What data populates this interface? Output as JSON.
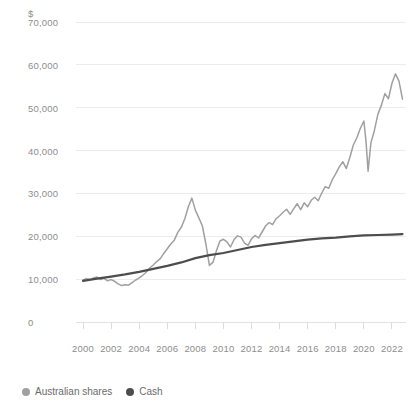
{
  "chart_data": {
    "type": "line",
    "title": "",
    "subtitle": "",
    "xlabel": "",
    "ylabel": "",
    "unit_label": "$",
    "grid": true,
    "legend_position": "bottom-left",
    "xlim": [
      1999.5,
      2023.0
    ],
    "ylim": [
      0,
      70000
    ],
    "ytick_labels": [
      "70,000",
      "60,000",
      "50,000",
      "40,000",
      "30,000",
      "20,000",
      "10,000",
      "0"
    ],
    "ytick_values": [
      70000,
      60000,
      50000,
      40000,
      30000,
      20000,
      10000,
      0
    ],
    "xtick_labels": [
      "2000",
      "2002",
      "2004",
      "2006",
      "2008",
      "2010",
      "2012",
      "2014",
      "2016",
      "2018",
      "2020",
      "2022"
    ],
    "xtick_values": [
      2000,
      2002,
      2004,
      2006,
      2008,
      2010,
      2012,
      2014,
      2016,
      2018,
      2020,
      2022
    ],
    "series": [
      {
        "name": "Australian shares",
        "color": "#a0a0a0",
        "x": [
          2000.0,
          2000.25,
          2000.5,
          2000.75,
          2001.0,
          2001.25,
          2001.5,
          2001.75,
          2002.0,
          2002.25,
          2002.5,
          2002.75,
          2003.0,
          2003.25,
          2003.5,
          2003.75,
          2004.0,
          2004.25,
          2004.5,
          2004.75,
          2005.0,
          2005.25,
          2005.5,
          2005.75,
          2006.0,
          2006.25,
          2006.5,
          2006.75,
          2007.0,
          2007.25,
          2007.5,
          2007.75,
          2008.0,
          2008.25,
          2008.5,
          2008.75,
          2009.0,
          2009.25,
          2009.5,
          2009.75,
          2010.0,
          2010.25,
          2010.5,
          2010.75,
          2011.0,
          2011.25,
          2011.5,
          2011.75,
          2012.0,
          2012.25,
          2012.5,
          2012.75,
          2013.0,
          2013.25,
          2013.5,
          2013.75,
          2014.0,
          2014.25,
          2014.5,
          2014.75,
          2015.0,
          2015.25,
          2015.5,
          2015.75,
          2016.0,
          2016.25,
          2016.5,
          2016.75,
          2017.0,
          2017.25,
          2017.5,
          2017.75,
          2018.0,
          2018.25,
          2018.5,
          2018.75,
          2019.0,
          2019.25,
          2019.5,
          2019.75,
          2020.0,
          2020.15,
          2020.3,
          2020.5,
          2020.75,
          2021.0,
          2021.25,
          2021.5,
          2021.75,
          2022.0,
          2022.25,
          2022.5,
          2022.75
        ],
        "values": [
          9800,
          10100,
          9900,
          10300,
          10500,
          9900,
          10200,
          9600,
          9900,
          9500,
          8900,
          8500,
          8700,
          8600,
          9200,
          9800,
          10300,
          10900,
          11600,
          12600,
          13300,
          14100,
          14800,
          16000,
          17100,
          18200,
          19100,
          20900,
          22100,
          24100,
          26900,
          28900,
          26100,
          24300,
          22400,
          18200,
          13200,
          13900,
          16600,
          18900,
          19300,
          18700,
          17500,
          19200,
          20100,
          19800,
          18400,
          17900,
          19400,
          20200,
          19600,
          21000,
          22400,
          23200,
          22700,
          24100,
          24800,
          25600,
          26300,
          25100,
          26400,
          27600,
          26200,
          27800,
          26900,
          28400,
          29100,
          28300,
          30100,
          31600,
          31200,
          33200,
          34600,
          36200,
          37400,
          35800,
          38400,
          41300,
          43000,
          45200,
          46900,
          42200,
          35200,
          41800,
          44700,
          48500,
          50600,
          53300,
          52100,
          55700,
          57900,
          56200,
          52000
        ]
      },
      {
        "name": "Cash",
        "color": "#4d4d4d",
        "x": [
          2000.0,
          2001.0,
          2002.0,
          2003.0,
          2004.0,
          2005.0,
          2006.0,
          2007.0,
          2008.0,
          2009.0,
          2010.0,
          2011.0,
          2012.0,
          2013.0,
          2014.0,
          2015.0,
          2016.0,
          2017.0,
          2018.0,
          2019.0,
          2020.0,
          2021.0,
          2022.0,
          2022.75
        ],
        "values": [
          9600,
          10100,
          10600,
          11100,
          11700,
          12400,
          13100,
          13900,
          14900,
          15600,
          16100,
          16800,
          17500,
          18000,
          18400,
          18800,
          19200,
          19500,
          19700,
          20000,
          20200,
          20300,
          20400,
          20500
        ]
      }
    ]
  },
  "legend": {
    "items": [
      {
        "label": "Australian shares",
        "color": "#a0a0a0"
      },
      {
        "label": "Cash",
        "color": "#4d4d4d"
      }
    ]
  }
}
